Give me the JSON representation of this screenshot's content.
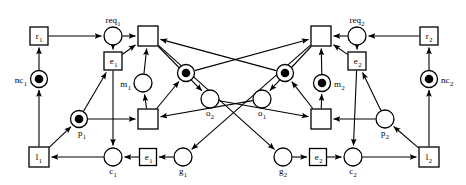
{
  "diagram": {
    "type": "petri-net",
    "canvas": {
      "width": 466,
      "height": 185
    },
    "colors": {
      "stroke": "#000000",
      "fill": "#ffffff",
      "token": "#000000"
    },
    "places": [
      {
        "id": "req1",
        "label": "req",
        "sub": "1",
        "x": 113,
        "y": 36,
        "r": 9,
        "tokens": 0,
        "label_pos": "above"
      },
      {
        "id": "nc1",
        "label": "nc",
        "sub": "1",
        "x": 39,
        "y": 79,
        "r": 8.5,
        "tokens": 1,
        "label_pos": "left"
      },
      {
        "id": "m1",
        "label": "m",
        "sub": "1",
        "x": 143,
        "y": 83,
        "r": 9,
        "tokens": 0,
        "label_pos": "left"
      },
      {
        "id": "t1a",
        "label": "",
        "sub": "",
        "x": 186,
        "y": 73,
        "r": 8.5,
        "tokens": 1,
        "label_pos": "none"
      },
      {
        "id": "o2",
        "label": "o",
        "sub": "2",
        "x": 210,
        "y": 99,
        "r": 9,
        "tokens": 0,
        "label_pos": "below"
      },
      {
        "id": "o1",
        "label": "o",
        "sub": "1",
        "x": 262,
        "y": 99,
        "r": 9,
        "tokens": 0,
        "label_pos": "below"
      },
      {
        "id": "t2a",
        "label": "",
        "sub": "",
        "x": 285,
        "y": 73,
        "r": 8.5,
        "tokens": 1,
        "label_pos": "none"
      },
      {
        "id": "m2",
        "label": "m",
        "sub": "2",
        "x": 322,
        "y": 83,
        "r": 8.5,
        "tokens": 1,
        "label_pos": "right"
      },
      {
        "id": "req2",
        "label": "req",
        "sub": "2",
        "x": 357,
        "y": 36,
        "r": 9,
        "tokens": 0,
        "label_pos": "above"
      },
      {
        "id": "nc2",
        "label": "nc",
        "sub": "2",
        "x": 429,
        "y": 79,
        "r": 8.5,
        "tokens": 1,
        "label_pos": "right"
      },
      {
        "id": "p1",
        "label": "p",
        "sub": "1",
        "x": 79,
        "y": 119,
        "r": 8.5,
        "tokens": 1,
        "label_pos": "below-right"
      },
      {
        "id": "p2",
        "label": "p",
        "sub": "2",
        "x": 385,
        "y": 119,
        "r": 9,
        "tokens": 0,
        "label_pos": "below"
      },
      {
        "id": "c1",
        "label": "c",
        "sub": "1",
        "x": 113,
        "y": 157,
        "r": 9,
        "tokens": 0,
        "label_pos": "below"
      },
      {
        "id": "g1",
        "label": "g",
        "sub": "1",
        "x": 183,
        "y": 157,
        "r": 9,
        "tokens": 0,
        "label_pos": "below"
      },
      {
        "id": "g2",
        "label": "g",
        "sub": "2",
        "x": 283,
        "y": 157,
        "r": 9,
        "tokens": 0,
        "label_pos": "below"
      },
      {
        "id": "c2",
        "label": "c",
        "sub": "2",
        "x": 353,
        "y": 157,
        "r": 9,
        "tokens": 0,
        "label_pos": "below"
      }
    ],
    "transitions": [
      {
        "id": "r1",
        "label": "r",
        "sub": "1",
        "x": 39,
        "y": 36,
        "w": 18,
        "h": 18,
        "labelled": true
      },
      {
        "id": "e1t",
        "label": "e",
        "sub": "1",
        "x": 113,
        "y": 61,
        "w": 18,
        "h": 18,
        "labelled": true
      },
      {
        "id": "T1",
        "label": "",
        "sub": "",
        "x": 148,
        "y": 36,
        "w": 20,
        "h": 20,
        "labelled": false
      },
      {
        "id": "T2",
        "label": "",
        "sub": "",
        "x": 148,
        "y": 119,
        "w": 20,
        "h": 20,
        "labelled": false
      },
      {
        "id": "l1",
        "label": "l",
        "sub": "1",
        "x": 39,
        "y": 157,
        "w": 20,
        "h": 20,
        "labelled": true
      },
      {
        "id": "e1b",
        "label": "e",
        "sub": "1",
        "x": 148,
        "y": 157,
        "w": 17,
        "h": 17,
        "labelled": true
      },
      {
        "id": "r2",
        "label": "r",
        "sub": "2",
        "x": 429,
        "y": 36,
        "w": 18,
        "h": 18,
        "labelled": true
      },
      {
        "id": "e2t",
        "label": "e",
        "sub": "2",
        "x": 357,
        "y": 61,
        "w": 18,
        "h": 18,
        "labelled": true
      },
      {
        "id": "T3",
        "label": "",
        "sub": "",
        "x": 321,
        "y": 36,
        "w": 20,
        "h": 20,
        "labelled": false
      },
      {
        "id": "T4",
        "label": "",
        "sub": "",
        "x": 321,
        "y": 119,
        "w": 20,
        "h": 20,
        "labelled": false
      },
      {
        "id": "l2",
        "label": "l",
        "sub": "2",
        "x": 429,
        "y": 157,
        "w": 20,
        "h": 20,
        "labelled": true
      },
      {
        "id": "e2b",
        "label": "e",
        "sub": "2",
        "x": 318,
        "y": 157,
        "w": 17,
        "h": 17,
        "labelled": true
      }
    ],
    "arcs": [
      {
        "from": "r1",
        "to": "req1",
        "name": "arc-r1-req1"
      },
      {
        "from": "nc1",
        "to": "r1",
        "name": "arc-nc1-r1"
      },
      {
        "from": "req1",
        "to": "T1",
        "name": "arc-req1-T1"
      },
      {
        "from": "req1",
        "to": "e1t",
        "name": "arc-req1-e1t"
      },
      {
        "from": "m1",
        "to": "T1",
        "name": "arc-m1-T1"
      },
      {
        "from": "T2",
        "to": "m1",
        "name": "arc-T2-m1"
      },
      {
        "from": "e1t",
        "to": "T1",
        "name": "arc-e1t-T1"
      },
      {
        "from": "p1",
        "to": "e1t",
        "name": "arc-p1-e1t"
      },
      {
        "from": "p1",
        "to": "T2",
        "name": "arc-p1-T2"
      },
      {
        "from": "e1t",
        "to": "c1",
        "name": "arc-e1t-c1"
      },
      {
        "from": "c1",
        "to": "l1",
        "name": "arc-c1-l1"
      },
      {
        "from": "l1",
        "to": "nc1",
        "name": "arc-l1-nc1"
      },
      {
        "from": "e1b",
        "to": "c1",
        "name": "arc-e1b-c1"
      },
      {
        "from": "g1",
        "to": "e1b",
        "name": "arc-g1-e1b"
      },
      {
        "from": "T2",
        "to": "t1a",
        "name": "arc-T2-t1a"
      },
      {
        "from": "t1a",
        "to": "T3",
        "name": "arc-t1a-T3"
      },
      {
        "from": "T1",
        "to": "o2",
        "name": "arc-T1-o2"
      },
      {
        "from": "o2",
        "to": "T4",
        "name": "arc-o2-T4"
      },
      {
        "from": "r2",
        "to": "req2",
        "name": "arc-r2-req2"
      },
      {
        "from": "nc2",
        "to": "r2",
        "name": "arc-nc2-r2"
      },
      {
        "from": "req2",
        "to": "T3",
        "name": "arc-req2-T3"
      },
      {
        "from": "req2",
        "to": "e2t",
        "name": "arc-req2-e2t"
      },
      {
        "from": "m2",
        "to": "T3",
        "name": "arc-m2-T3"
      },
      {
        "from": "T4",
        "to": "m2",
        "name": "arc-T4-m2"
      },
      {
        "from": "e2t",
        "to": "T3",
        "name": "arc-e2t-T3"
      },
      {
        "from": "p2",
        "to": "e2t",
        "name": "arc-p2-e2t"
      },
      {
        "from": "p2",
        "to": "T4",
        "name": "arc-p2-T4"
      },
      {
        "from": "e2t",
        "to": "c2",
        "name": "arc-e2t-c2"
      },
      {
        "from": "c2",
        "to": "l2",
        "name": "arc-c2-l2"
      },
      {
        "from": "l2",
        "to": "nc2",
        "name": "arc-l2-nc2"
      },
      {
        "from": "e2b",
        "to": "c2",
        "name": "arc-e2b-c2"
      },
      {
        "from": "g2",
        "to": "e2b",
        "name": "arc-g2-e2b"
      },
      {
        "from": "T4",
        "to": "t2a",
        "name": "arc-T4-t2a"
      },
      {
        "from": "t2a",
        "to": "T1",
        "name": "arc-t2a-T1"
      },
      {
        "from": "T3",
        "to": "o1",
        "name": "arc-T3-o1"
      },
      {
        "from": "o1",
        "to": "T2",
        "name": "arc-o1-T2"
      },
      {
        "from": "T3",
        "to": "g1",
        "name": "arc-T3-g1"
      },
      {
        "from": "T1",
        "to": "g2",
        "name": "arc-T1-g2"
      },
      {
        "from": "l1",
        "to": "p1",
        "name": "arc-l1-p1"
      },
      {
        "from": "l2",
        "to": "p2",
        "name": "arc-l2-p2"
      }
    ]
  }
}
